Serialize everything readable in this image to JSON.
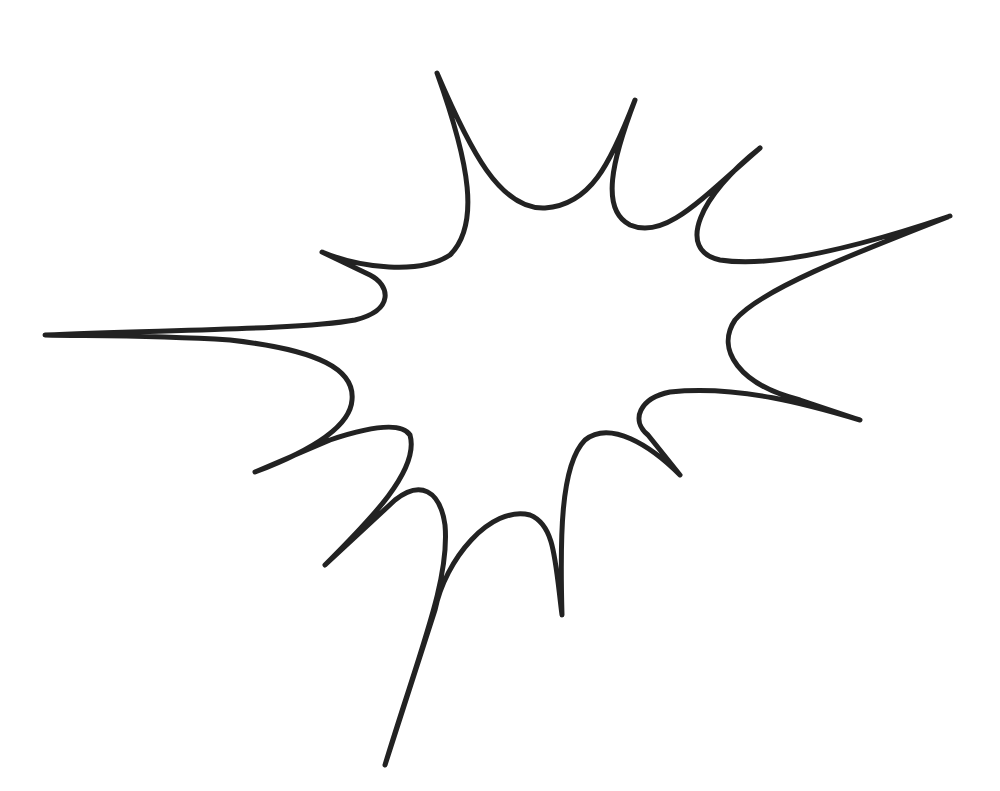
{
  "image": {
    "description": "Comic-style explosion burst outline",
    "background_color": "#ffffff",
    "stroke_color": "#222222"
  },
  "burst": {
    "spikes": [
      {
        "name": "left",
        "tip": [
          45,
          335
        ]
      },
      {
        "name": "upper-left",
        "tip": [
          322,
          252
        ]
      },
      {
        "name": "top-left",
        "tip": [
          437,
          73
        ]
      },
      {
        "name": "top-center",
        "tip": [
          635,
          100
        ]
      },
      {
        "name": "top-right",
        "tip": [
          760,
          148
        ]
      },
      {
        "name": "right",
        "tip": [
          950,
          216
        ]
      },
      {
        "name": "lower-right",
        "tip": [
          860,
          420
        ]
      },
      {
        "name": "bottom-right",
        "tip": [
          680,
          475
        ]
      },
      {
        "name": "bottom-center",
        "tip": [
          562,
          615
        ]
      },
      {
        "name": "bottom",
        "tip": [
          385,
          765
        ]
      },
      {
        "name": "bottom-left",
        "tip": [
          325,
          565
        ]
      },
      {
        "name": "lower-left",
        "tip": [
          255,
          472
        ]
      }
    ]
  }
}
